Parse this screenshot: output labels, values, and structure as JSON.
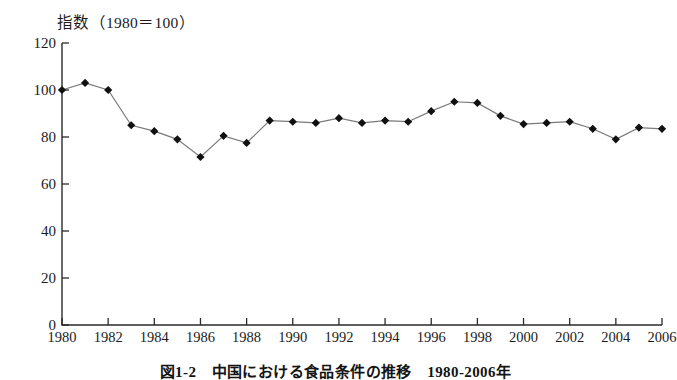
{
  "chart_data": {
    "type": "line",
    "title": "指数（1980＝100）",
    "caption": "図1-2　中国における食品条件の推移　1980-2006年",
    "xlabel": "",
    "ylabel": "指数（1980＝100）",
    "xlim": [
      1980,
      2006
    ],
    "ylim": [
      0,
      120
    ],
    "grid": false,
    "legend": null,
    "marker": "diamond",
    "line_color": "#7a7a7a",
    "marker_color": "#101010",
    "axis_color": "#2b2b2b",
    "y_ticks": [
      0,
      20,
      40,
      60,
      80,
      100,
      120
    ],
    "x_ticks": [
      1980,
      1982,
      1984,
      1986,
      1988,
      1990,
      1992,
      1994,
      1996,
      1998,
      2000,
      2002,
      2004,
      2006
    ],
    "x": [
      1980,
      1981,
      1982,
      1983,
      1984,
      1985,
      1986,
      1987,
      1988,
      1989,
      1990,
      1991,
      1992,
      1993,
      1994,
      1995,
      1996,
      1997,
      1998,
      1999,
      2000,
      2001,
      2002,
      2003,
      2004,
      2005,
      2006
    ],
    "values": [
      100,
      103,
      100,
      85,
      82.5,
      79,
      71.5,
      80.5,
      77.5,
      87,
      86.5,
      86,
      88,
      86,
      87,
      86.5,
      91,
      95,
      94.5,
      89,
      85.5,
      86,
      86.5,
      83.5,
      79,
      84,
      83.5
    ],
    "series": [
      {
        "name": "指数",
        "values": [
          100,
          103,
          100,
          85,
          82.5,
          79,
          71.5,
          80.5,
          77.5,
          87,
          86.5,
          86,
          88,
          86,
          87,
          86.5,
          91,
          95,
          94.5,
          89,
          85.5,
          86,
          86.5,
          83.5,
          79,
          84,
          83.5
        ]
      }
    ]
  }
}
